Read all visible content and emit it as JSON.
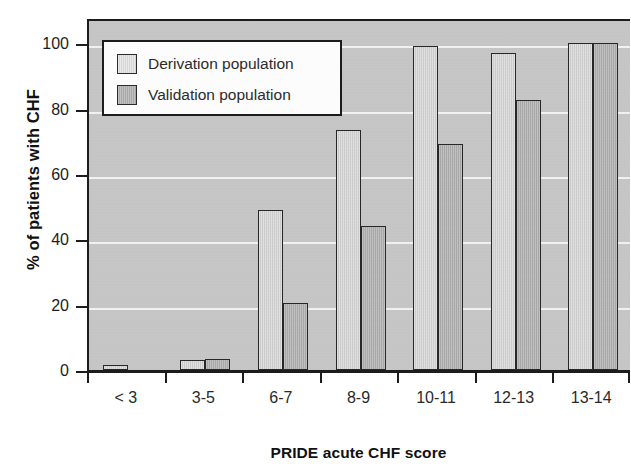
{
  "chart_data": {
    "type": "bar",
    "title": "",
    "xlabel": "PRIDE acute CHF score",
    "ylabel": "% of patients with CHF",
    "categories": [
      "< 3",
      "3-5",
      "6-7",
      "8-9",
      "10-11",
      "12-13",
      "13-14"
    ],
    "series": [
      {
        "name": "Derivation population",
        "values": [
          1.5,
          3,
          49,
          73.5,
          99,
          97,
          100
        ],
        "fill": "#d7d7d7",
        "stroke": "#1e1e1e"
      },
      {
        "name": "Validation population",
        "values": [
          0,
          3.5,
          20.5,
          44,
          69,
          82.5,
          100
        ],
        "fill": "#b2b2b2",
        "stroke": "#1e1e1e"
      }
    ],
    "ylim": [
      0,
      108
    ],
    "yticks": [
      0,
      20,
      40,
      60,
      80,
      100
    ],
    "ytick_labels": [
      "0",
      "20",
      "40",
      "60",
      "80",
      "100"
    ],
    "grid": true,
    "grid_color": "#fbfbfb",
    "legend_position": "upper-left",
    "plot_background": "#c9c9c9",
    "axis_color": "#1c1c1c"
  },
  "legend": {
    "items": [
      {
        "label": "Derivation population",
        "swatch": "derivation"
      },
      {
        "label": "Validation population",
        "swatch": "validation"
      }
    ]
  },
  "axes": {
    "y_title": "% of patients with CHF",
    "x_title": "PRIDE acute CHF score"
  }
}
